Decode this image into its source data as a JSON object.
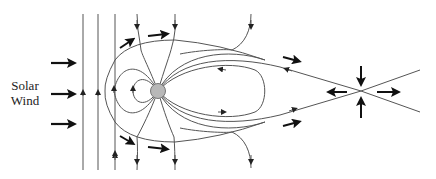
{
  "diagram": {
    "labels": {
      "solar_wind_line1": "Solar",
      "solar_wind_line2": "Wind"
    },
    "colors": {
      "field_line": "#555555",
      "arrow": "#111111",
      "earth_fill": "#b8b8b8",
      "earth_stroke": "#777777",
      "background": "#ffffff"
    },
    "elements": {
      "earth": {
        "cx": 158,
        "cy": 91,
        "r": 7
      },
      "x_point": {
        "x": 361,
        "y": 91
      },
      "solar_wind_arrows": 3,
      "flow_arrows": 8,
      "reconnection_arrows": 4
    }
  }
}
